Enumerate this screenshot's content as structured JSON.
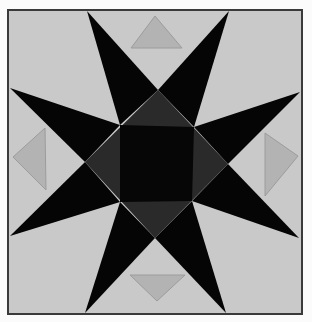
{
  "image": {
    "subject": "Quilt block: eight-pointed star",
    "width": 312,
    "height": 322
  },
  "colors": {
    "page_background": "#fbfbfb",
    "block_background": "#c9c9c9",
    "border": "#3a3a3a",
    "star_points": "#050505",
    "center_diamond": "#2a2a2a",
    "center_square": "#060606",
    "accent_triangles": "#b3b3b3",
    "accent_triangle_stroke": "#9c9c9c"
  },
  "block": {
    "x": 8,
    "y": 10,
    "width": 294,
    "height": 304
  },
  "star": {
    "inner_square": {
      "top_left": [
        120,
        125
      ],
      "top_right": [
        194,
        127
      ],
      "bottom_right": [
        192,
        201
      ],
      "bottom_left": [
        120,
        202
      ]
    },
    "diamond": {
      "top": [
        158,
        90
      ],
      "right": [
        228,
        164
      ],
      "bottom": [
        155,
        238
      ],
      "left": [
        85,
        162
      ]
    },
    "points": {
      "top_left": [
        87,
        11
      ],
      "top_right": [
        229,
        11
      ],
      "right_top": [
        300,
        92
      ],
      "right_bottom": [
        299,
        238
      ],
      "bottom_right": [
        226,
        313
      ],
      "bottom_left": [
        85,
        313
      ],
      "left_bottom": [
        10,
        236
      ],
      "left_top": [
        10,
        88
      ]
    }
  },
  "accent_triangles": {
    "top": [
      [
        155,
        16
      ],
      [
        182,
        48
      ],
      [
        131,
        48
      ]
    ],
    "bottom": [
      [
        130,
        275
      ],
      [
        185,
        275
      ],
      [
        157,
        301
      ]
    ],
    "left": [
      [
        13,
        157
      ],
      [
        45,
        128
      ],
      [
        46,
        190
      ]
    ],
    "right": [
      [
        298,
        156
      ],
      [
        265,
        133
      ],
      [
        265,
        196
      ]
    ]
  }
}
